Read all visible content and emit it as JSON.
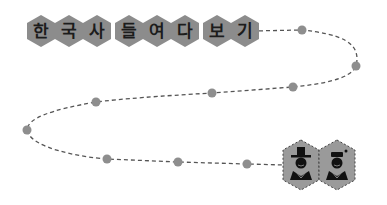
{
  "title": {
    "letters": [
      "한",
      "국",
      "사",
      "들",
      "여",
      "다",
      "보",
      "기"
    ],
    "groups": [
      [
        "한",
        "국",
        "사"
      ],
      [
        "들",
        "여",
        "다"
      ],
      [
        "보",
        "기"
      ]
    ],
    "hex_color": "#8c8c8c",
    "text_color": "#1c1c1c"
  },
  "path": {
    "dash_color": "#555555",
    "dot_color": "#8e8e8e",
    "dots": [
      {
        "x": 302,
        "y": 30
      },
      {
        "x": 356,
        "y": 66
      },
      {
        "x": 293,
        "y": 87
      },
      {
        "x": 212,
        "y": 93
      },
      {
        "x": 96,
        "y": 102
      },
      {
        "x": 27,
        "y": 130
      },
      {
        "x": 107,
        "y": 159
      },
      {
        "x": 178,
        "y": 162
      },
      {
        "x": 247,
        "y": 164
      }
    ]
  },
  "characters": [
    {
      "name": "scholar-with-gat",
      "hex_color": "#9a9a9a"
    },
    {
      "name": "person-with-cap",
      "hex_color": "#9a9a9a"
    }
  ]
}
